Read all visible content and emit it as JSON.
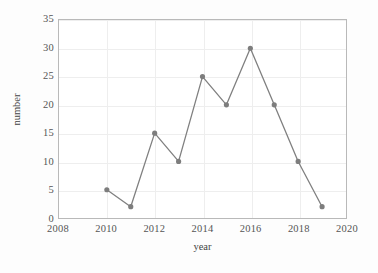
{
  "chart_data": {
    "type": "line",
    "title": "",
    "xlabel": "year",
    "ylabel": "number",
    "x": [
      2010,
      2011,
      2012,
      2013,
      2014,
      2015,
      2016,
      2017,
      2018,
      2019
    ],
    "values": [
      5,
      2,
      15,
      10,
      25,
      20,
      30,
      20,
      10,
      2
    ],
    "series": [
      {
        "name": "number",
        "values": [
          5,
          2,
          15,
          10,
          25,
          20,
          30,
          20,
          10,
          2
        ]
      }
    ],
    "xlim": [
      2008,
      2020
    ],
    "ylim": [
      0,
      35
    ],
    "xticks": [
      2008,
      2010,
      2012,
      2014,
      2016,
      2018,
      2020
    ],
    "yticks": [
      0,
      5,
      10,
      15,
      20,
      25,
      30,
      35
    ],
    "xtick_labels": [
      "2008",
      "2010",
      "2012",
      "2014",
      "2016",
      "2018",
      "2020"
    ],
    "ytick_labels": [
      "0",
      "5",
      "10",
      "15",
      "20",
      "25",
      "30",
      "35"
    ],
    "grid": true,
    "grid_color": "#eeeeee",
    "legend": false,
    "legend_position": "none",
    "line_color": "#808080",
    "marker_color": "#7d7d7d",
    "marker": "circle",
    "frame_color": "#b9b9b9",
    "background": "#ffffff",
    "figure_background": "#fdfdfd"
  }
}
